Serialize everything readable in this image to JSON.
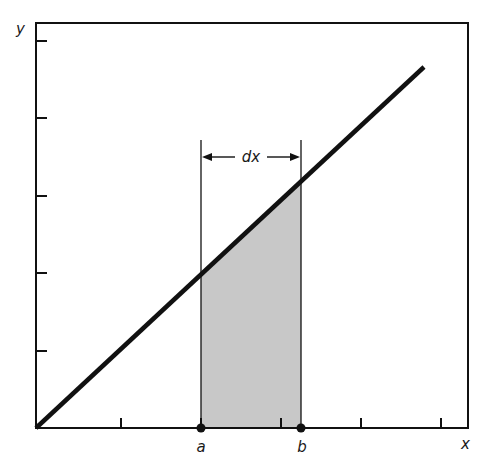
{
  "figure": {
    "colors": {
      "ink": "#111111",
      "shade": "#c8c8c8",
      "background": "#ffffff"
    },
    "frame": {
      "left": 36,
      "top": 23,
      "right": 468,
      "bottom": 428
    },
    "axes": {
      "x_label": "x",
      "y_label": "y",
      "x_ticks": [
        121,
        201,
        281,
        361,
        441
      ],
      "y_ticks": [
        41,
        118,
        196,
        273,
        351
      ]
    },
    "line": {
      "x1": 36,
      "y1": 428,
      "x2": 424,
      "y2": 67
    },
    "points": [
      {
        "name": "a",
        "label": "a",
        "x": 201
      },
      {
        "name": "b",
        "label": "b",
        "x": 301
      }
    ],
    "interval": {
      "label": "dx",
      "y": 157,
      "guide_top": 140
    }
  }
}
